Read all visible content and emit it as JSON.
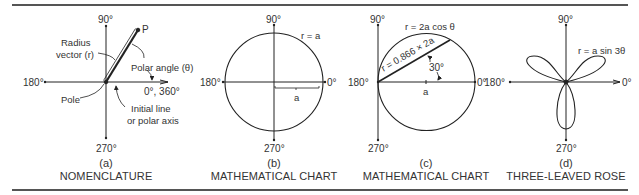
{
  "figure": {
    "panels": [
      {
        "letter": "(a)",
        "title": "NOMENCLATURE",
        "axis_labels": {
          "top": "90°",
          "left": "180°",
          "right": "0°, 360°",
          "bottom": "270°"
        },
        "annotations": {
          "point": "P",
          "radius_line1": "Radius",
          "radius_line2": "vector (r)",
          "polar_angle": "Polar angle (θ)",
          "pole": "Pole",
          "initial_line1": "Initial line",
          "initial_line2": "or polar axis"
        }
      },
      {
        "letter": "(b)",
        "title": "MATHEMATICAL CHART",
        "axis_labels": {
          "top": "90°",
          "left": "180°",
          "right": "0°",
          "bottom": "270°"
        },
        "equation": "r = a",
        "radius_label": "a"
      },
      {
        "letter": "(c)",
        "title": "MATHEMATICAL CHART",
        "axis_labels": {
          "top": "90°",
          "left": "180°",
          "right": "0°",
          "bottom": "270°"
        },
        "equation": "r = 2a cos θ",
        "chord_label": "r = 0.866 × 2a",
        "angle_label": "30°",
        "center_label": "a"
      },
      {
        "letter": "(d)",
        "title": "THREE-LEAVED ROSE",
        "axis_labels": {
          "top": "90°",
          "left": "180°",
          "right": "0°",
          "bottom": "270°"
        },
        "equation": "r = a sin 3θ"
      }
    ]
  }
}
